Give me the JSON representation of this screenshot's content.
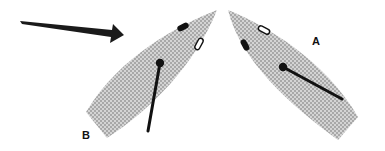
{
  "diagram": {
    "type": "sailing-boats-wind",
    "wind_arrow": {
      "direction": "left-to-right",
      "color": "#1a1a1a"
    },
    "boats": [
      {
        "id": "B",
        "label": "B",
        "hull_color": "#c8c8c8",
        "hatch": true
      },
      {
        "id": "A",
        "label": "A",
        "hull_color": "#c8c8c8",
        "hatch": true
      }
    ],
    "colors": {
      "hull": "#cfcfcf",
      "hatch": "#a9a9a9",
      "ink": "#111111",
      "background": "#ffffff"
    }
  }
}
